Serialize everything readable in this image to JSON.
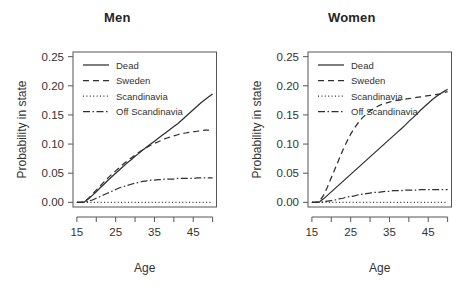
{
  "figure": {
    "background": "#ffffff",
    "ink": "#2f2f2f"
  },
  "panels": [
    {
      "id": "men",
      "title": "Men"
    },
    {
      "id": "women",
      "title": "Women"
    }
  ],
  "axes": {
    "xlabel": "Age",
    "ylabel": "Probability in state",
    "xlim": [
      14,
      51
    ],
    "ylim": [
      -0.008,
      0.258
    ],
    "x_ticks": [
      15,
      20,
      25,
      30,
      35,
      40,
      45,
      50
    ],
    "x_tick_labels": [
      "15",
      "",
      "25",
      "",
      "35",
      "",
      "45",
      ""
    ],
    "y_ticks": [
      0.0,
      0.05,
      0.1,
      0.15,
      0.2,
      0.25
    ],
    "y_tick_labels": [
      "0.00",
      "0.05",
      "0.10",
      "0.15",
      "0.20",
      "0.25"
    ],
    "grid": false
  },
  "legend": {
    "position": "top-left-inside",
    "entries": [
      {
        "label": "Dead",
        "style": "solid"
      },
      {
        "label": "Sweden",
        "style": "dashed"
      },
      {
        "label": "Scandinavia",
        "style": "dotted"
      },
      {
        "label": "Off Scandinavia",
        "style": "dashdot"
      }
    ]
  },
  "chart_data": [
    {
      "type": "line",
      "title": "Men",
      "xlabel": "Age",
      "ylabel": "Probability in state",
      "xlim": [
        14,
        51
      ],
      "ylim": [
        0.0,
        0.25
      ],
      "grid": false,
      "legend_position": "top-left-inside",
      "x": [
        15,
        16,
        17,
        18,
        19,
        20,
        21,
        22,
        23,
        24,
        25,
        26,
        27,
        28,
        29,
        30,
        31,
        32,
        33,
        34,
        35,
        36,
        37,
        38,
        39,
        40,
        41,
        42,
        43,
        44,
        45,
        46,
        47,
        48,
        49,
        50
      ],
      "series": [
        {
          "name": "Dead",
          "style": "solid",
          "values": [
            0.0,
            0.0,
            0.001,
            0.006,
            0.012,
            0.018,
            0.025,
            0.031,
            0.038,
            0.044,
            0.05,
            0.056,
            0.062,
            0.068,
            0.073,
            0.079,
            0.084,
            0.09,
            0.095,
            0.1,
            0.105,
            0.11,
            0.115,
            0.12,
            0.125,
            0.13,
            0.135,
            0.141,
            0.147,
            0.153,
            0.159,
            0.165,
            0.171,
            0.176,
            0.181,
            0.186
          ]
        },
        {
          "name": "Sweden",
          "style": "dashed",
          "values": [
            0.0,
            0.0,
            0.001,
            0.007,
            0.014,
            0.021,
            0.028,
            0.035,
            0.042,
            0.048,
            0.054,
            0.06,
            0.066,
            0.071,
            0.076,
            0.081,
            0.086,
            0.09,
            0.094,
            0.098,
            0.101,
            0.104,
            0.107,
            0.11,
            0.112,
            0.114,
            0.116,
            0.118,
            0.119,
            0.12,
            0.121,
            0.122,
            0.123,
            0.124,
            0.124,
            0.125
          ]
        },
        {
          "name": "Scandinavia",
          "style": "dotted",
          "values": [
            0.0,
            0.0,
            0.0,
            0.0,
            0.0,
            0.0,
            0.0,
            0.0,
            0.0,
            0.0,
            0.0,
            0.0,
            0.0,
            0.0,
            0.0,
            0.0,
            0.0,
            0.0,
            0.0,
            0.0,
            0.0,
            0.0,
            0.0,
            0.0,
            0.0,
            0.0,
            0.0,
            0.0,
            0.0,
            0.0,
            0.0,
            0.0,
            0.0,
            0.0,
            0.0,
            0.0
          ]
        },
        {
          "name": "Off Scandinavia",
          "style": "dashdot",
          "values": [
            0.0,
            0.0,
            0.0,
            0.002,
            0.004,
            0.007,
            0.01,
            0.013,
            0.016,
            0.019,
            0.022,
            0.025,
            0.027,
            0.029,
            0.031,
            0.033,
            0.034,
            0.036,
            0.037,
            0.038,
            0.038,
            0.039,
            0.039,
            0.04,
            0.04,
            0.04,
            0.041,
            0.041,
            0.041,
            0.041,
            0.041,
            0.042,
            0.042,
            0.042,
            0.042,
            0.042
          ]
        }
      ]
    },
    {
      "type": "line",
      "title": "Women",
      "xlabel": "Age",
      "ylabel": "Probability in state",
      "xlim": [
        14,
        51
      ],
      "ylim": [
        0.0,
        0.25
      ],
      "grid": false,
      "legend_position": "top-left-inside",
      "x": [
        15,
        16,
        17,
        18,
        19,
        20,
        21,
        22,
        23,
        24,
        25,
        26,
        27,
        28,
        29,
        30,
        31,
        32,
        33,
        34,
        35,
        36,
        37,
        38,
        39,
        40,
        41,
        42,
        43,
        44,
        45,
        46,
        47,
        48,
        49,
        50
      ],
      "series": [
        {
          "name": "Dead",
          "style": "solid",
          "values": [
            0.0,
            0.0,
            0.001,
            0.006,
            0.012,
            0.018,
            0.024,
            0.03,
            0.036,
            0.042,
            0.048,
            0.054,
            0.06,
            0.066,
            0.072,
            0.078,
            0.084,
            0.09,
            0.096,
            0.102,
            0.108,
            0.114,
            0.12,
            0.126,
            0.132,
            0.139,
            0.145,
            0.151,
            0.158,
            0.164,
            0.17,
            0.176,
            0.181,
            0.186,
            0.19,
            0.194
          ]
        },
        {
          "name": "Sweden",
          "style": "dashed",
          "values": [
            0.0,
            0.0,
            0.002,
            0.012,
            0.026,
            0.042,
            0.058,
            0.074,
            0.09,
            0.104,
            0.117,
            0.128,
            0.137,
            0.145,
            0.151,
            0.157,
            0.161,
            0.165,
            0.168,
            0.17,
            0.172,
            0.174,
            0.175,
            0.176,
            0.177,
            0.178,
            0.179,
            0.18,
            0.181,
            0.182,
            0.183,
            0.184,
            0.185,
            0.186,
            0.188,
            0.19
          ]
        },
        {
          "name": "Scandinavia",
          "style": "dotted",
          "values": [
            0.0,
            0.0,
            0.0,
            0.0,
            0.0,
            0.0,
            0.0,
            0.0,
            0.0,
            0.0,
            0.0,
            0.0,
            0.0,
            0.0,
            0.0,
            0.0,
            0.0,
            0.0,
            0.0,
            0.0,
            0.0,
            0.0,
            0.0,
            0.0,
            0.0,
            0.0,
            0.0,
            0.0,
            0.0,
            0.0,
            0.0,
            0.0,
            0.0,
            0.0,
            0.0,
            0.0
          ]
        },
        {
          "name": "Off Scandinavia",
          "style": "dashdot",
          "values": [
            0.0,
            0.0,
            0.0,
            0.001,
            0.002,
            0.003,
            0.004,
            0.006,
            0.007,
            0.009,
            0.01,
            0.011,
            0.013,
            0.014,
            0.015,
            0.016,
            0.017,
            0.017,
            0.018,
            0.019,
            0.019,
            0.02,
            0.02,
            0.02,
            0.021,
            0.021,
            0.021,
            0.021,
            0.022,
            0.022,
            0.022,
            0.022,
            0.022,
            0.022,
            0.022,
            0.022
          ]
        }
      ]
    }
  ]
}
